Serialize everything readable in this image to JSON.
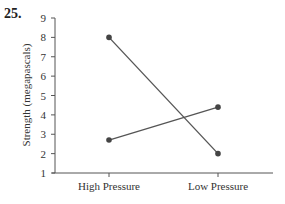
{
  "question_number": "25.",
  "chart_data": {
    "type": "line",
    "title": "",
    "xlabel": "",
    "ylabel": "Strength (megapascals)",
    "categories": [
      "High Pressure",
      "Low Pressure"
    ],
    "series": [
      {
        "name": "Series A",
        "values": [
          8,
          2
        ]
      },
      {
        "name": "Series B",
        "values": [
          2.7,
          4.4
        ]
      }
    ],
    "ylim": [
      1,
      9
    ],
    "yticks": [
      1,
      2,
      3,
      4,
      5,
      6,
      7,
      8,
      9
    ],
    "grid": false,
    "legend": "none",
    "line_color": "#555555",
    "marker_color": "#444444"
  }
}
